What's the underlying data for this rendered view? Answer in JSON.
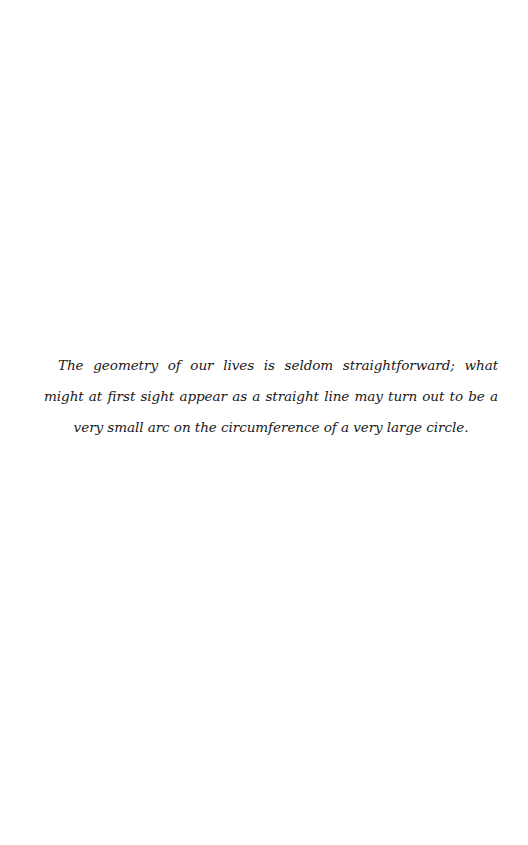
{
  "page": {
    "epigraph": "The geometry of our lives is seldom straightforward; what might at first sight appear as a straight line may turn out to be a very small arc on the circumference of a very large circle."
  }
}
